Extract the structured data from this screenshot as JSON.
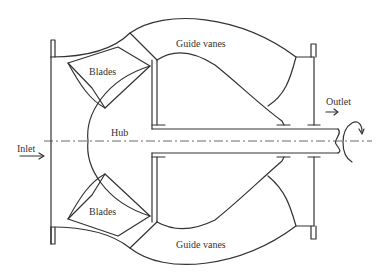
{
  "diagram": {
    "labels": {
      "guide_vanes_top": "Guide vanes",
      "guide_vanes_bottom": "Guide vanes",
      "blades_top": "Blades",
      "blades_bottom": "Blades",
      "hub": "Hub",
      "inlet": "Inlet",
      "outlet": "Outlet"
    },
    "colors": {
      "line": "#333333",
      "background": "#ffffff"
    }
  }
}
